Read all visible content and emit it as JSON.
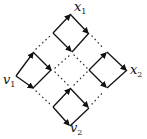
{
  "diagram": {
    "labels": {
      "x1": {
        "main": "x",
        "sub": "1"
      },
      "x2": {
        "main": "x",
        "sub": "2"
      },
      "v1": {
        "main": "v",
        "sub": "1"
      },
      "v2": {
        "main": "v",
        "sub": "2"
      }
    },
    "colors": {
      "stroke": "#111111",
      "dots": "#333333",
      "background": "#ffffff"
    },
    "diamonds": [
      {
        "name": "left",
        "points": [
          [
            16,
            76
          ],
          [
            33,
            52
          ],
          [
            52,
            70
          ],
          [
            33,
            88
          ]
        ]
      },
      {
        "name": "top",
        "points": [
          [
            53,
            33
          ],
          [
            70,
            14
          ],
          [
            89,
            33
          ],
          [
            72,
            52
          ]
        ]
      },
      {
        "name": "right",
        "points": [
          [
            89,
            70
          ],
          [
            107,
            52
          ],
          [
            127,
            70
          ],
          [
            107,
            88
          ]
        ]
      },
      {
        "name": "bottom",
        "points": [
          [
            53,
            107
          ],
          [
            70,
            88
          ],
          [
            89,
            108
          ],
          [
            70,
            126
          ]
        ]
      }
    ]
  }
}
